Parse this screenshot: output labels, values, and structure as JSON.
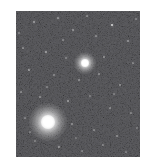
{
  "image": {
    "type": "astronomical-starfield",
    "title": "",
    "width": 149,
    "height": 165,
    "margin_color": "#ffffff",
    "field": {
      "x": 16,
      "y": 11,
      "width": 124,
      "height": 146,
      "background_color": "#040404",
      "noise_color": "#2a2a2a"
    },
    "objects": [
      {
        "name": "globular-cluster",
        "label": "Globular cluster",
        "cx": 48,
        "cy": 122,
        "core_radius": 7,
        "halo_radius": 19,
        "peak_color": "#ffffff",
        "brightness": 1.0
      },
      {
        "name": "bright-star",
        "label": "Bright star",
        "cx": 85,
        "cy": 63,
        "core_radius": 4,
        "halo_radius": 11,
        "peak_color": "#ffffff",
        "brightness": 0.92
      }
    ],
    "field_stars": [
      {
        "x": 112,
        "y": 25,
        "r": 1.2,
        "b": 0.8
      },
      {
        "x": 34,
        "y": 22,
        "r": 0.7,
        "b": 0.4
      },
      {
        "x": 58,
        "y": 18,
        "r": 0.6,
        "b": 0.34
      },
      {
        "x": 73,
        "y": 30,
        "r": 0.7,
        "b": 0.38
      },
      {
        "x": 96,
        "y": 36,
        "r": 0.6,
        "b": 0.3
      },
      {
        "x": 128,
        "y": 41,
        "r": 0.7,
        "b": 0.36
      },
      {
        "x": 23,
        "y": 48,
        "r": 0.6,
        "b": 0.3
      },
      {
        "x": 46,
        "y": 52,
        "r": 0.8,
        "b": 0.44
      },
      {
        "x": 66,
        "y": 58,
        "r": 0.6,
        "b": 0.28
      },
      {
        "x": 104,
        "y": 57,
        "r": 0.7,
        "b": 0.34
      },
      {
        "x": 133,
        "y": 63,
        "r": 0.6,
        "b": 0.3
      },
      {
        "x": 29,
        "y": 70,
        "r": 0.8,
        "b": 0.42
      },
      {
        "x": 54,
        "y": 75,
        "r": 0.6,
        "b": 0.28
      },
      {
        "x": 79,
        "y": 80,
        "r": 0.7,
        "b": 0.36
      },
      {
        "x": 99,
        "y": 74,
        "r": 0.6,
        "b": 0.3
      },
      {
        "x": 120,
        "y": 85,
        "r": 0.7,
        "b": 0.34
      },
      {
        "x": 21,
        "y": 92,
        "r": 0.6,
        "b": 0.28
      },
      {
        "x": 40,
        "y": 97,
        "r": 0.7,
        "b": 0.33
      },
      {
        "x": 68,
        "y": 101,
        "r": 0.8,
        "b": 0.42
      },
      {
        "x": 90,
        "y": 96,
        "r": 0.6,
        "b": 0.26
      },
      {
        "x": 110,
        "y": 108,
        "r": 0.7,
        "b": 0.32
      },
      {
        "x": 131,
        "y": 113,
        "r": 0.6,
        "b": 0.28
      },
      {
        "x": 25,
        "y": 118,
        "r": 0.6,
        "b": 0.26
      },
      {
        "x": 72,
        "y": 124,
        "r": 0.7,
        "b": 0.34
      },
      {
        "x": 94,
        "y": 130,
        "r": 0.6,
        "b": 0.28
      },
      {
        "x": 117,
        "y": 136,
        "r": 0.7,
        "b": 0.32
      },
      {
        "x": 35,
        "y": 141,
        "r": 0.6,
        "b": 0.26
      },
      {
        "x": 59,
        "y": 147,
        "r": 0.8,
        "b": 0.4
      },
      {
        "x": 82,
        "y": 151,
        "r": 0.6,
        "b": 0.26
      },
      {
        "x": 103,
        "y": 145,
        "r": 0.7,
        "b": 0.3
      },
      {
        "x": 126,
        "y": 152,
        "r": 0.6,
        "b": 0.24
      },
      {
        "x": 19,
        "y": 33,
        "r": 0.6,
        "b": 0.26
      },
      {
        "x": 87,
        "y": 16,
        "r": 0.6,
        "b": 0.28
      },
      {
        "x": 136,
        "y": 19,
        "r": 0.6,
        "b": 0.24
      },
      {
        "x": 63,
        "y": 40,
        "r": 0.6,
        "b": 0.26
      },
      {
        "x": 114,
        "y": 94,
        "r": 0.6,
        "b": 0.24
      },
      {
        "x": 47,
        "y": 87,
        "r": 0.6,
        "b": 0.24
      },
      {
        "x": 30,
        "y": 132,
        "r": 0.6,
        "b": 0.24
      },
      {
        "x": 76,
        "y": 138,
        "r": 0.6,
        "b": 0.22
      },
      {
        "x": 137,
        "y": 128,
        "r": 0.6,
        "b": 0.22
      }
    ]
  }
}
